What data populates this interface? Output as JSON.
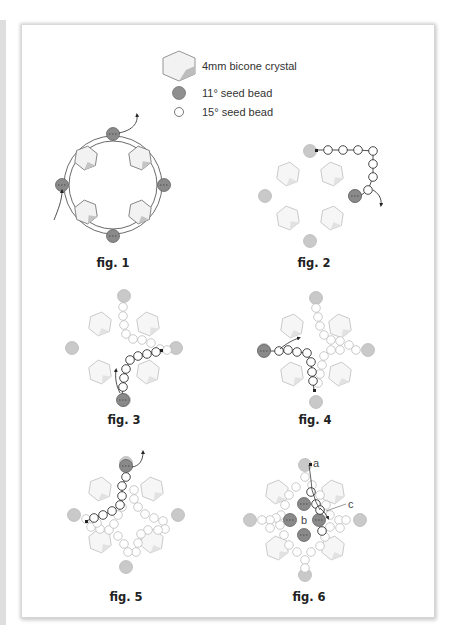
{
  "legend": {
    "items": [
      {
        "icon": "bicone-crystal-icon",
        "label": "4mm bicone crystal"
      },
      {
        "icon": "seed-bead-11-icon",
        "label": "11° seed bead"
      },
      {
        "icon": "seed-bead-15-icon",
        "label": "15° seed bead"
      }
    ]
  },
  "colors": {
    "crystal_fill": "#f0f0f0",
    "crystal_stroke": "#9a9a9a",
    "crystal_shade": "#c8c8c8",
    "bead11_active": "#8a8a8a",
    "bead11_faded": "#c9c9c9",
    "bead15_fill": "#ffffff",
    "thread": "#222222"
  },
  "figures": [
    {
      "id": "fig1",
      "caption": "fig. 1"
    },
    {
      "id": "fig2",
      "caption": "fig. 2"
    },
    {
      "id": "fig3",
      "caption": "fig. 3"
    },
    {
      "id": "fig4",
      "caption": "fig. 4"
    },
    {
      "id": "fig5",
      "caption": "fig. 5"
    },
    {
      "id": "fig6",
      "caption": "fig. 6",
      "labels": [
        "a",
        "b",
        "c"
      ]
    }
  ]
}
